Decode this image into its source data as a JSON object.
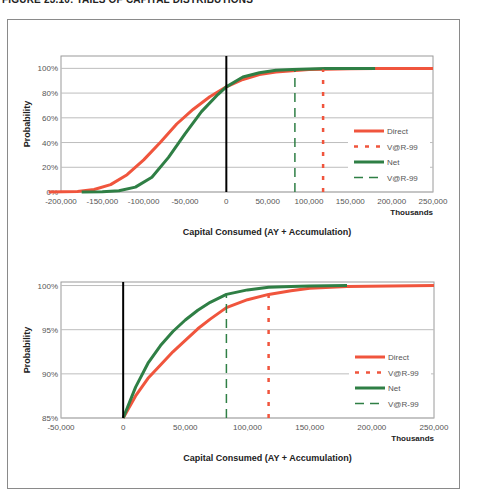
{
  "figure": {
    "title": "FIGURE 23.10: TAILS OF CAPITAL DISTRIBUTIONS"
  },
  "colors": {
    "direct": "#f0553d",
    "net": "#2f7f45",
    "zero_line": "#000000",
    "grid": "#bdbdbd",
    "plot_border": "#9a9a9a"
  },
  "chart_data": [
    {
      "type": "line",
      "title": "",
      "xlabel": "Capital Consumed (AY + Accumulation)",
      "xunit": "Thousands",
      "ylabel": "Probability",
      "xlim": [
        -200000,
        250000
      ],
      "ylim": [
        0,
        1.1
      ],
      "xticks": [
        -200000,
        -150000,
        -100000,
        -50000,
        0,
        50000,
        100000,
        150000,
        200000,
        250000
      ],
      "xtick_labels": [
        "-200,000",
        "-150,000",
        "-100,000",
        "-50,000",
        "0",
        "50,000",
        "100,000",
        "150,000",
        "200,000",
        "250,000"
      ],
      "yticks": [
        0,
        0.2,
        0.4,
        0.6,
        0.8,
        1.0
      ],
      "ytick_labels": [
        "0%",
        "20%",
        "40%",
        "60%",
        "80%",
        "100%"
      ],
      "grid": true,
      "legend_position": "lower right",
      "legend": [
        "Direct",
        "V@R-99",
        "Net",
        "V@R-99"
      ],
      "series": [
        {
          "name": "Direct",
          "style": "solid",
          "x": [
            -215000,
            -180000,
            -160000,
            -140000,
            -120000,
            -100000,
            -80000,
            -60000,
            -40000,
            -20000,
            0,
            20000,
            40000,
            60000,
            80000,
            100000,
            120000,
            150000,
            180000,
            250000
          ],
          "y": [
            0.0,
            0.005,
            0.02,
            0.06,
            0.14,
            0.26,
            0.4,
            0.55,
            0.67,
            0.77,
            0.85,
            0.91,
            0.95,
            0.97,
            0.98,
            0.99,
            0.993,
            0.997,
            0.999,
            1.0
          ]
        },
        {
          "name": "Net",
          "style": "solid",
          "x": [
            -175000,
            -150000,
            -130000,
            -110000,
            -90000,
            -70000,
            -50000,
            -30000,
            -10000,
            0,
            20000,
            40000,
            60000,
            80000,
            100000,
            120000,
            150000,
            180000
          ],
          "y": [
            0.0,
            0.002,
            0.01,
            0.04,
            0.12,
            0.28,
            0.47,
            0.65,
            0.79,
            0.85,
            0.93,
            0.965,
            0.985,
            0.99,
            0.995,
            0.998,
            0.999,
            1.0
          ]
        },
        {
          "name": "V@R-99 (Direct)",
          "style": "dotted",
          "x": [
            117000,
            117000
          ],
          "y": [
            0.0,
            0.99
          ]
        },
        {
          "name": "V@R-99 (Net)",
          "style": "dashed",
          "x": [
            83000,
            83000
          ],
          "y": [
            0.0,
            0.99
          ]
        }
      ]
    },
    {
      "type": "line",
      "title": "",
      "xlabel": "Capital Consumed (AY + Accumulation)",
      "xunit": "Thousands",
      "ylabel": "Probability",
      "xlim": [
        -50000,
        250000
      ],
      "ylim": [
        0.85,
        1.004
      ],
      "xticks": [
        -50000,
        0,
        50000,
        100000,
        150000,
        200000,
        250000
      ],
      "xtick_labels": [
        "-50,000",
        "0",
        "50,000",
        "100,000",
        "150,000",
        "200,000",
        "250,000"
      ],
      "yticks": [
        0.85,
        0.9,
        0.95,
        1.0
      ],
      "ytick_labels": [
        "85%",
        "90%",
        "95%",
        "100%"
      ],
      "grid": true,
      "legend_position": "lower right",
      "legend": [
        "Direct",
        "V@R-99",
        "Net",
        "V@R-99"
      ],
      "series": [
        {
          "name": "Direct",
          "style": "solid",
          "x": [
            0,
            10000,
            20000,
            30000,
            40000,
            50000,
            60000,
            70000,
            83000,
            100000,
            117000,
            135000,
            150000,
            180000,
            250000
          ],
          "y": [
            0.85,
            0.875,
            0.895,
            0.91,
            0.925,
            0.938,
            0.951,
            0.962,
            0.975,
            0.984,
            0.99,
            0.994,
            0.997,
            0.999,
            1.0
          ]
        },
        {
          "name": "Net",
          "style": "solid",
          "x": [
            0,
            10000,
            20000,
            30000,
            40000,
            50000,
            60000,
            70000,
            83000,
            100000,
            117000,
            135000,
            150000,
            180000
          ],
          "y": [
            0.85,
            0.885,
            0.912,
            0.932,
            0.948,
            0.961,
            0.972,
            0.981,
            0.99,
            0.995,
            0.998,
            0.999,
            0.9995,
            1.0
          ]
        },
        {
          "name": "V@R-99 (Direct)",
          "style": "dotted",
          "x": [
            117000,
            117000
          ],
          "y": [
            0.85,
            0.99
          ]
        },
        {
          "name": "V@R-99 (Net)",
          "style": "dashed",
          "x": [
            83000,
            83000
          ],
          "y": [
            0.85,
            0.99
          ]
        }
      ]
    }
  ]
}
